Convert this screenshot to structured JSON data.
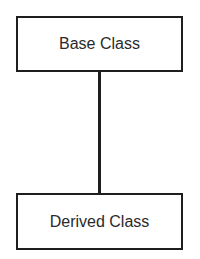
{
  "diagram": {
    "nodes": [
      {
        "id": "base",
        "label": "Base Class"
      },
      {
        "id": "derived",
        "label": "Derived Class"
      }
    ],
    "edges": [
      {
        "from": "base",
        "to": "derived"
      }
    ]
  }
}
